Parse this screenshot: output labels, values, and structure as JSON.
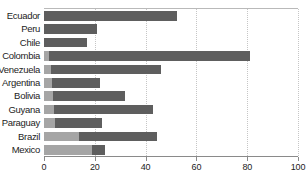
{
  "chart_data": {
    "type": "bar",
    "orientation": "horizontal",
    "stacked": true,
    "title": "",
    "xlabel": "",
    "ylabel": "",
    "xlim": [
      0,
      100
    ],
    "xticks": [
      0,
      20,
      40,
      60,
      80,
      100
    ],
    "xtick_labels": [
      "0",
      "20",
      "40",
      "60",
      "80",
      "100"
    ],
    "grid": "vertical-dotted",
    "legend_position": "none",
    "categories": [
      "Ecuador",
      "Peru",
      "Chile",
      "Colombia",
      "Venezuela",
      "Argentina",
      "Bolivia",
      "Guyana",
      "Paraguay",
      "Brazil",
      "Mexico"
    ],
    "series": [
      {
        "name": "light-segment",
        "color": "#a5a5a5",
        "values": [
          0,
          0,
          0,
          1.8,
          2.6,
          3.0,
          3.6,
          3.8,
          4.4,
          13.8,
          19.0
        ]
      },
      {
        "name": "dark-segment",
        "color": "#5e5e5e",
        "values": [
          52.4,
          21.0,
          17.0,
          79.2,
          43.4,
          19.0,
          28.4,
          39.2,
          18.6,
          30.7,
          5.0
        ]
      }
    ],
    "totals": [
      52.4,
      21.0,
      17.0,
      81.0,
      46.0,
      22.0,
      32.0,
      43.0,
      23.0,
      44.5,
      24.0
    ],
    "colors": {
      "light": "#a5a5a5",
      "dark": "#5e5e5e",
      "axis": "#8a8a8a",
      "grid": "#c6c6c6",
      "top_rule": "#b9b9b9",
      "text": "#1c1c1c",
      "background": "#ffffff"
    }
  }
}
